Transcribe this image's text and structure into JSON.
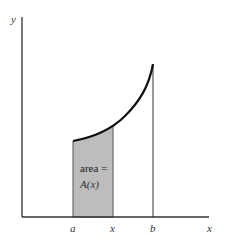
{
  "diagram": {
    "type": "area-under-curve",
    "axes": {
      "x_label": "x",
      "y_label": "y"
    },
    "ticks": [
      {
        "id": "a",
        "label": "a"
      },
      {
        "id": "x",
        "label": "x"
      },
      {
        "id": "b",
        "label": "b"
      }
    ],
    "shaded_region": {
      "label_line1": "area =",
      "label_line2": "A(x)",
      "fill": "#bdbdbd"
    },
    "colors": {
      "axis": "#333333",
      "curve": "#111111",
      "shade": "#bdbdbd"
    }
  }
}
